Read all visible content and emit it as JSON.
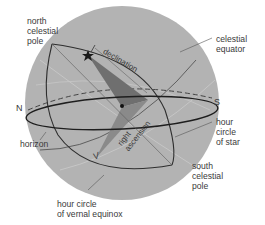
{
  "diagram": {
    "type": "celestial-sphere",
    "colors": {
      "sphere": "#b3b3b3",
      "wedge_dark": "#6f6f6f",
      "wedge_light": "#8a8a8a",
      "line": "#2e2e2e",
      "text": "#3a3a3a",
      "background": "#ffffff"
    },
    "labels": {
      "north_celestial_pole": "north\ncelestial\npole",
      "celestial_equator": "celestial\nequator",
      "north": "N",
      "south": "S",
      "horizon": "horizon",
      "hour_circle_of_star": "hour\ncircle\nof star",
      "south_celestial_pole": "south\ncelestial\npole",
      "hour_circle_vernal": "hour circle\nof vernal equinox",
      "declination": "declination",
      "right_ascension": "right\nascension",
      "vernal_equinox_symbol": "V"
    },
    "markers": {
      "star": "star-icon",
      "center": "center-dot"
    }
  }
}
